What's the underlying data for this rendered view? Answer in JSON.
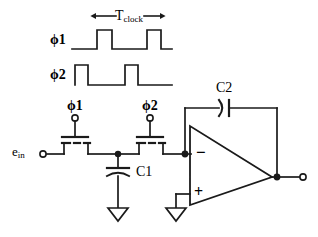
{
  "figure": {
    "ink_color": "#1a1a1a",
    "background_color": "#ffffff"
  },
  "timing_diagram": {
    "period_label": {
      "base": "T",
      "subscript": "clock",
      "arrows": "double-headed"
    },
    "traces": [
      {
        "name": "phi1",
        "label_base": "ϕ1",
        "label_phi": "ϕ",
        "label_index": "1",
        "initial_level": "low",
        "pulses": 2
      },
      {
        "name": "phi2",
        "label_base": "ϕ2",
        "label_phi": "ϕ",
        "label_index": "2",
        "initial_level": "high",
        "pulses": 2
      }
    ]
  },
  "circuit": {
    "input_terminal": {
      "label_base": "e",
      "label_subscript": "in",
      "terminal_type": "open-circle"
    },
    "switches": [
      {
        "name": "switch-phi1",
        "gate_label_phi": "ϕ",
        "gate_label_index": "1",
        "gate_label": "ϕ1",
        "device": "mosfet-pass-transistor",
        "terminal_type": "open-circle"
      },
      {
        "name": "switch-phi2",
        "gate_label_phi": "ϕ",
        "gate_label_index": "2",
        "gate_label": "ϕ2",
        "device": "mosfet-pass-transistor",
        "terminal_type": "open-circle"
      }
    ],
    "capacitors": [
      {
        "name": "sampling-capacitor",
        "label": "C1",
        "orientation": "vertical",
        "connection": "node-to-ground"
      },
      {
        "name": "feedback-capacitor",
        "label": "C2",
        "orientation": "horizontal",
        "connection": "inverting-input-to-output"
      }
    ],
    "opamp": {
      "name": "operational-amplifier",
      "inverting_input_label": "−",
      "noninverting_input_label": "+",
      "noninverting_input_connection": "ground"
    },
    "output_terminal": {
      "terminal_type": "open-circle"
    },
    "grounds": [
      {
        "name": "ground-c1",
        "symbol": "triangle"
      },
      {
        "name": "ground-opamp-plus",
        "symbol": "triangle"
      }
    ]
  }
}
